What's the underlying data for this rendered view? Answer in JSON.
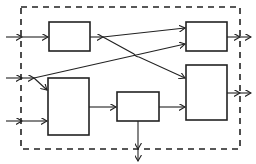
{
  "diagram": {
    "type": "block-diagram",
    "boundary": {
      "style": "dashed",
      "x": 21,
      "y": 7,
      "width": 219,
      "height": 142
    },
    "colors": {
      "stroke": "#222222",
      "background": "#ffffff"
    },
    "blocks": [
      {
        "id": "A",
        "label": "",
        "x": 49,
        "y": 22,
        "width": 41,
        "height": 29
      },
      {
        "id": "B",
        "label": "",
        "x": 48,
        "y": 78,
        "width": 41,
        "height": 57
      },
      {
        "id": "C",
        "label": "",
        "x": 117,
        "y": 92,
        "width": 42,
        "height": 29
      },
      {
        "id": "D",
        "label": "",
        "x": 186,
        "y": 22,
        "width": 41,
        "height": 29
      },
      {
        "id": "E",
        "label": "",
        "x": 186,
        "y": 65,
        "width": 41,
        "height": 55
      }
    ],
    "inputs": [
      {
        "id": "in1",
        "y": 37,
        "target": "A"
      },
      {
        "id": "in2",
        "y": 78,
        "targets": [
          "D",
          "B"
        ]
      },
      {
        "id": "in3",
        "y": 121,
        "target": "B"
      }
    ],
    "connections": [
      {
        "from": "A",
        "to": "D"
      },
      {
        "from": "A",
        "to": "E"
      },
      {
        "from": "in2",
        "to": "D"
      },
      {
        "from": "in2",
        "to": "B"
      },
      {
        "from": "B",
        "to": "C"
      },
      {
        "from": "C",
        "to": "E"
      }
    ],
    "outputs": [
      {
        "id": "out1",
        "from": "D",
        "direction": "right"
      },
      {
        "id": "out2",
        "from": "E",
        "direction": "right"
      },
      {
        "id": "out3",
        "from": "C",
        "direction": "down"
      }
    ],
    "labels": {
      "A": "",
      "B": "",
      "C": "",
      "D": "",
      "E": ""
    }
  }
}
